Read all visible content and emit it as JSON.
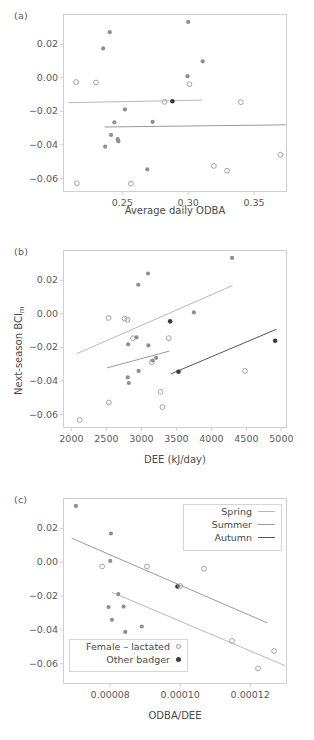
{
  "figure": {
    "panels": [
      {
        "tag": "(a)",
        "xlabel": "Average daily ODBA",
        "ylabel": "",
        "xticks": [
          "0.25",
          "0.30",
          "0.35"
        ],
        "yticks": [
          "0.02",
          "0.00",
          "-0.02",
          "-0.04",
          "-0.06"
        ]
      },
      {
        "tag": "(b)",
        "xlabel": "DEE (kJ/day)",
        "ylabel": "Next-season BCI",
        "ylabel_sub": "m",
        "xticks": [
          "2000",
          "2500",
          "3000",
          "3500",
          "4000",
          "4500",
          "5000"
        ],
        "yticks": [
          "0.02",
          "0.00",
          "-0.02",
          "-0.04",
          "-0.06"
        ]
      },
      {
        "tag": "(c)",
        "xlabel": "ODBA/DEE",
        "ylabel": "",
        "xticks": [
          "0.00008",
          "0.00010",
          "0.00012"
        ],
        "yticks": [
          "0.02",
          "0.00",
          "-0.02",
          "-0.04",
          "-0.06"
        ]
      }
    ],
    "season_legend": {
      "items": [
        {
          "label": "Spring",
          "color": "#b9b9b9"
        },
        {
          "label": "Summer",
          "color": "#9a9a9a"
        },
        {
          "label": "Autumn",
          "color": "#555555"
        }
      ]
    },
    "marker_legend": {
      "items": [
        {
          "label": "Female – lactated",
          "marker": "open-circle"
        },
        {
          "label": "Other badger",
          "marker": "filled-circle"
        }
      ]
    },
    "colors": {
      "axis": "#cfcfcf",
      "tick_text": "#5a5a5a",
      "spring_line": "#b9b9b9",
      "summer_line": "#9a9a9a",
      "autumn_line": "#555555",
      "point_open": "#9a9a9a",
      "point_filled_light": "#8f8f8f",
      "point_filled_dark": "#3c3c3c"
    }
  },
  "chart_data": [
    {
      "type": "scatter",
      "panel": "(a)",
      "title": "",
      "xlabel": "Average daily ODBA",
      "ylabel": "Next-season BCIm",
      "xlim": [
        0.205,
        0.375
      ],
      "ylim": [
        -0.068,
        0.038
      ],
      "xticks": [
        0.25,
        0.3,
        0.35
      ],
      "yticks": [
        0.02,
        0.0,
        -0.02,
        -0.04,
        -0.06
      ],
      "grid": false,
      "legend": "none",
      "points": [
        {
          "x": 0.215,
          "y": -0.0025,
          "style": "open"
        },
        {
          "x": 0.2155,
          "y": -0.0628,
          "style": "open"
        },
        {
          "x": 0.23,
          "y": -0.0028,
          "style": "open"
        },
        {
          "x": 0.2355,
          "y": 0.0175,
          "style": "filled-light"
        },
        {
          "x": 0.237,
          "y": -0.041,
          "style": "filled-light"
        },
        {
          "x": 0.2405,
          "y": 0.0272,
          "style": "filled-light"
        },
        {
          "x": 0.2415,
          "y": -0.034,
          "style": "filled-light"
        },
        {
          "x": 0.244,
          "y": -0.0265,
          "style": "filled-light"
        },
        {
          "x": 0.2465,
          "y": -0.0365,
          "style": "filled-light"
        },
        {
          "x": 0.247,
          "y": -0.0378,
          "style": "filled-light"
        },
        {
          "x": 0.252,
          "y": -0.0188,
          "style": "filled-light"
        },
        {
          "x": 0.2565,
          "y": -0.063,
          "style": "open"
        },
        {
          "x": 0.269,
          "y": -0.0545,
          "style": "filled-light"
        },
        {
          "x": 0.273,
          "y": -0.0262,
          "style": "filled-light"
        },
        {
          "x": 0.282,
          "y": -0.0143,
          "style": "open"
        },
        {
          "x": 0.288,
          "y": -0.014,
          "style": "filled-dark"
        },
        {
          "x": 0.2995,
          "y": 0.001,
          "style": "filled-light"
        },
        {
          "x": 0.3,
          "y": 0.0333,
          "style": "filled-light"
        },
        {
          "x": 0.301,
          "y": -0.0038,
          "style": "open"
        },
        {
          "x": 0.311,
          "y": 0.0098,
          "style": "filled-light"
        },
        {
          "x": 0.3195,
          "y": -0.0525,
          "style": "open"
        },
        {
          "x": 0.3295,
          "y": -0.0553,
          "style": "open"
        },
        {
          "x": 0.34,
          "y": -0.0145,
          "style": "open"
        },
        {
          "x": 0.37,
          "y": -0.0458,
          "style": "open"
        }
      ],
      "lines": [
        {
          "name": "Spring",
          "color": "#b9b9b9",
          "x": [
            0.209,
            0.3105
          ],
          "y": [
            -0.0148,
            -0.0133
          ]
        },
        {
          "name": "Summer",
          "color": "#9a9a9a",
          "x": [
            0.2365,
            0.374
          ],
          "y": [
            -0.0293,
            -0.028
          ]
        }
      ]
    },
    {
      "type": "scatter",
      "panel": "(b)",
      "title": "",
      "xlabel": "DEE (kJ/day)",
      "ylabel": "Next-season BCIm",
      "xlim": [
        1880,
        5080
      ],
      "ylim": [
        -0.068,
        0.038
      ],
      "xticks": [
        2000,
        2500,
        3000,
        3500,
        4000,
        4500,
        5000
      ],
      "yticks": [
        0.02,
        0.0,
        -0.02,
        -0.04,
        -0.06
      ],
      "grid": false,
      "legend": "none",
      "points": [
        {
          "x": 2120,
          "y": -0.0632,
          "style": "open"
        },
        {
          "x": 2530,
          "y": -0.0025,
          "style": "open"
        },
        {
          "x": 2535,
          "y": -0.0528,
          "style": "open"
        },
        {
          "x": 2760,
          "y": -0.0028,
          "style": "open"
        },
        {
          "x": 2800,
          "y": -0.0035,
          "style": "open"
        },
        {
          "x": 2805,
          "y": -0.0378,
          "style": "filled-light"
        },
        {
          "x": 2810,
          "y": -0.0182,
          "style": "filled-light"
        },
        {
          "x": 2820,
          "y": -0.0412,
          "style": "filled-light"
        },
        {
          "x": 2880,
          "y": -0.0145,
          "style": "open"
        },
        {
          "x": 2930,
          "y": -0.014,
          "style": "filled-light"
        },
        {
          "x": 2955,
          "y": 0.0173,
          "style": "filled-light"
        },
        {
          "x": 2960,
          "y": -0.034,
          "style": "filled-light"
        },
        {
          "x": 3095,
          "y": 0.024,
          "style": "filled-light"
        },
        {
          "x": 3100,
          "y": -0.0188,
          "style": "filled-light"
        },
        {
          "x": 3150,
          "y": -0.0288,
          "style": "open"
        },
        {
          "x": 3160,
          "y": -0.0278,
          "style": "filled-light"
        },
        {
          "x": 3210,
          "y": -0.0262,
          "style": "filled-light"
        },
        {
          "x": 3275,
          "y": -0.0465,
          "style": "open"
        },
        {
          "x": 3300,
          "y": -0.0555,
          "style": "open"
        },
        {
          "x": 3390,
          "y": -0.0145,
          "style": "open"
        },
        {
          "x": 3410,
          "y": -0.0045,
          "style": "filled-dark"
        },
        {
          "x": 3530,
          "y": -0.0345,
          "style": "filled-dark"
        },
        {
          "x": 3750,
          "y": 0.0008,
          "style": "filled-light"
        },
        {
          "x": 4295,
          "y": 0.0333,
          "style": "filled-light"
        },
        {
          "x": 4480,
          "y": -0.034,
          "style": "open"
        },
        {
          "x": 4910,
          "y": -0.016,
          "style": "filled-dark"
        }
      ],
      "lines": [
        {
          "name": "Spring",
          "color": "#b9b9b9",
          "x": [
            2075,
            4300
          ],
          "y": [
            -0.0238,
            0.0168
          ]
        },
        {
          "name": "Summer",
          "color": "#9a9a9a",
          "x": [
            2510,
            3400
          ],
          "y": [
            -0.0322,
            -0.0222
          ]
        },
        {
          "name": "Autumn",
          "color": "#555555",
          "x": [
            3420,
            4930
          ],
          "y": [
            -0.0358,
            -0.0092
          ]
        }
      ]
    },
    {
      "type": "scatter",
      "panel": "(c)",
      "title": "",
      "xlabel": "ODBA/DEE",
      "ylabel": "Next-season BCIm",
      "xlim": [
        6.65e-05,
        0.0001305
      ],
      "ylim": [
        -0.072,
        0.038
      ],
      "xticks": [
        8e-05,
        0.0001,
        0.00012
      ],
      "yticks": [
        0.02,
        0.0,
        -0.02,
        -0.04,
        -0.06
      ],
      "grid": false,
      "legend": "inside",
      "points": [
        {
          "x": 7.02e-05,
          "y": 0.0333,
          "style": "filled-light"
        },
        {
          "x": 7.77e-05,
          "y": -0.0025,
          "style": "open"
        },
        {
          "x": 7.95e-05,
          "y": -0.0265,
          "style": "filled-light"
        },
        {
          "x": 8e-05,
          "y": 0.0008,
          "style": "filled-light"
        },
        {
          "x": 8.02e-05,
          "y": 0.017,
          "style": "filled-light"
        },
        {
          "x": 8.05e-05,
          "y": -0.034,
          "style": "filled-light"
        },
        {
          "x": 8.23e-05,
          "y": -0.0188,
          "style": "filled-light"
        },
        {
          "x": 8.38e-05,
          "y": -0.0262,
          "style": "filled-light"
        },
        {
          "x": 8.43e-05,
          "y": -0.0412,
          "style": "filled-light"
        },
        {
          "x": 8.9e-05,
          "y": -0.038,
          "style": "filled-light"
        },
        {
          "x": 9.05e-05,
          "y": -0.0025,
          "style": "open"
        },
        {
          "x": 9.92e-05,
          "y": -0.0143,
          "style": "filled-dark"
        },
        {
          "x": 0.0001,
          "y": -0.014,
          "style": "open"
        },
        {
          "x": 0.0001,
          "y": -0.0555,
          "style": "open"
        },
        {
          "x": 0.0001068,
          "y": -0.0038,
          "style": "open"
        },
        {
          "x": 0.0001148,
          "y": -0.0465,
          "style": "open"
        },
        {
          "x": 0.0001222,
          "y": -0.0628,
          "style": "open"
        },
        {
          "x": 0.0001268,
          "y": -0.0525,
          "style": "open"
        }
      ],
      "lines": [
        {
          "name": "Spring",
          "color": "#9a9a9a",
          "x": [
            6.9e-05,
            0.0001248
          ],
          "y": [
            0.0142,
            -0.0358
          ]
        },
        {
          "name": "Summer",
          "color": "#b9b9b9",
          "x": [
            8.05e-05,
            0.00013
          ],
          "y": [
            -0.0178,
            -0.0612
          ]
        }
      ]
    }
  ]
}
